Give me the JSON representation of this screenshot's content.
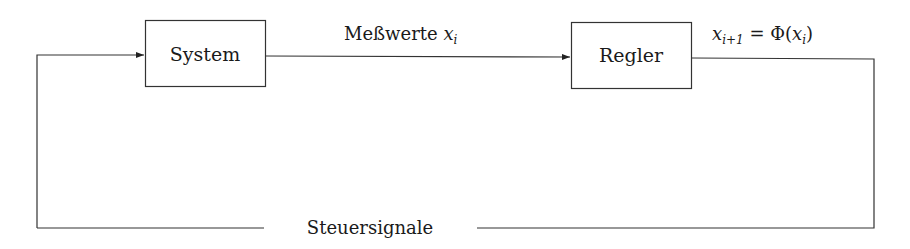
{
  "diagram": {
    "nodes": [
      {
        "id": "system",
        "label": "System"
      },
      {
        "id": "regler",
        "label": "Regler"
      }
    ],
    "edges": [
      {
        "from": "system",
        "to": "regler",
        "label_text": "Meßwerte ",
        "label_math": "x",
        "label_sub": "i"
      },
      {
        "from": "regler",
        "to": "output",
        "label": "x_{i+1} = Φ(x_i)",
        "label_parts": {
          "var": "x",
          "sub1": "i+1",
          "eq": " = Φ(",
          "var2": "x",
          "sub2": "i",
          "close": ")"
        }
      },
      {
        "from": "output",
        "to": "system",
        "label": "Steuersignale"
      }
    ],
    "colors": {
      "stroke": "#333333",
      "text": "#1a1a1a",
      "background": "#ffffff"
    }
  }
}
